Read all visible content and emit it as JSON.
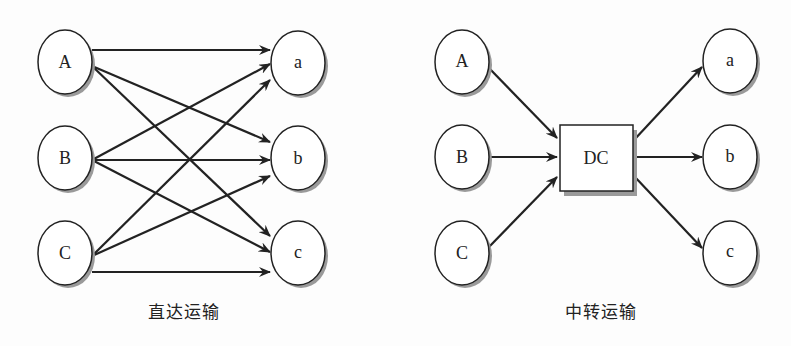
{
  "diagrams": [
    {
      "caption": "直达运输",
      "sources": [
        {
          "label": "A",
          "cx": 65,
          "cy": 62
        },
        {
          "label": "B",
          "cx": 65,
          "cy": 158
        },
        {
          "label": "C",
          "cx": 65,
          "cy": 253
        }
      ],
      "targets": [
        {
          "label": "a",
          "cx": 298,
          "cy": 63
        },
        {
          "label": "b",
          "cx": 298,
          "cy": 158
        },
        {
          "label": "c",
          "cx": 298,
          "cy": 253
        }
      ],
      "edges": [
        [
          "A",
          "a"
        ],
        [
          "A",
          "b"
        ],
        [
          "A",
          "c"
        ],
        [
          "B",
          "a"
        ],
        [
          "B",
          "b"
        ],
        [
          "B",
          "c"
        ],
        [
          "C",
          "a"
        ],
        [
          "C",
          "b"
        ],
        [
          "C",
          "c"
        ]
      ]
    },
    {
      "caption": "中转运输",
      "hub": {
        "label": "DC"
      },
      "sources": [
        {
          "label": "A"
        },
        {
          "label": "B"
        },
        {
          "label": "C"
        }
      ],
      "targets": [
        {
          "label": "a"
        },
        {
          "label": "b"
        },
        {
          "label": "c"
        }
      ]
    }
  ],
  "colors": {
    "stroke": "#222222",
    "shadow": "#9a9a9a",
    "fill": "#ffffff"
  }
}
